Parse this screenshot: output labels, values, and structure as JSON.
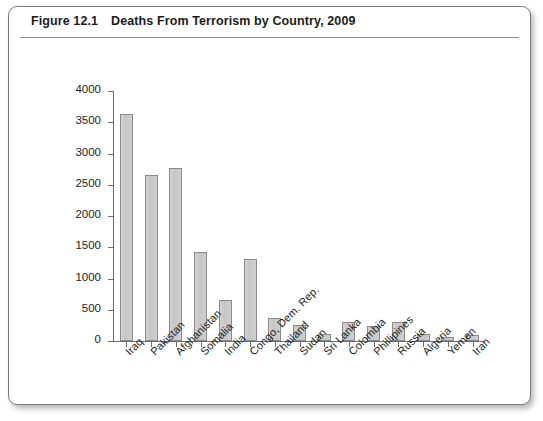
{
  "figure": {
    "number": "Figure 12.1",
    "title": "Deaths From Terrorism by Country, 2009"
  },
  "chart_data": {
    "type": "bar",
    "title": "Deaths From Terrorism by Country, 2009",
    "xlabel": "",
    "ylabel": "",
    "ylim": [
      0,
      4000
    ],
    "ytick_labels": [
      "4000",
      "3500",
      "3000",
      "2500",
      "2000",
      "1500",
      "1000",
      "500",
      "0"
    ],
    "yticks": [
      4000,
      3500,
      3000,
      2500,
      2000,
      1500,
      1000,
      500,
      0
    ],
    "grid": false,
    "legend": "none",
    "categories": [
      "Iraq",
      "Pakistan",
      "Afghanistan",
      "Somalia",
      "India",
      "Congo, Dem. Rep.",
      "Thailand",
      "Sudan",
      "Sri Lanka",
      "Colombia",
      "Phillipines",
      "Russia",
      "Algeria",
      "Yemen",
      "Iran"
    ],
    "values": [
      3630,
      2660,
      2770,
      1430,
      660,
      1320,
      370,
      260,
      110,
      300,
      240,
      310,
      110,
      60,
      100
    ],
    "bar_fill_color": "#c9c9c9",
    "bar_edge_color": "#8a8a8a"
  }
}
